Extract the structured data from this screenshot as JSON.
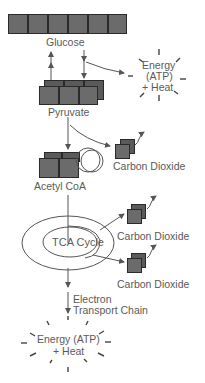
{
  "diagram": {
    "nodes": {
      "glucose": "Glucose",
      "pyruvate": "Pyruvate",
      "acetyl_coa": "Acetyl CoA",
      "tca_cycle": "TCA Cycle",
      "co2_1": "Carbon Dioxide",
      "co2_2": "Carbon Dioxide",
      "co2_3": "Carbon Dioxide",
      "etc_line1": "Electron",
      "etc_line2": "Transport Chain"
    },
    "energy_top": {
      "line1": "Energy",
      "line2": "(ATP)",
      "line3": "+ Heat"
    },
    "energy_bottom": {
      "line1": "Energy (ATP)",
      "line2": "+ Heat"
    },
    "colors": {
      "block_fill": "#6b6b6b",
      "block_border": "#2a2a2a",
      "line": "#555555",
      "text": "#5a5a5a"
    }
  }
}
